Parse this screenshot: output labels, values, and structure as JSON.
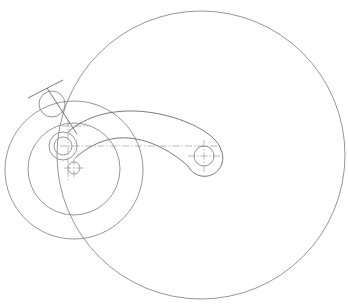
{
  "drawing": {
    "type": "mechanism-linkage-sketch",
    "line_color": "#8a8a8a",
    "background": "#ffffff",
    "circles": [
      {
        "name": "large-circle",
        "cx": 201,
        "cy": 155,
        "r": 144
      },
      {
        "name": "outer-concentric-circle",
        "cx": 74,
        "cy": 170,
        "r": 69
      },
      {
        "name": "inner-concentric-circle",
        "cx": 74,
        "cy": 169,
        "r": 46
      },
      {
        "name": "top-small-circle",
        "cx": 52,
        "cy": 104,
        "r": 13
      },
      {
        "name": "hub-outer-circle",
        "cx": 63,
        "cy": 146,
        "r": 14
      },
      {
        "name": "hub-inner-circle",
        "cx": 63,
        "cy": 146,
        "r": 9
      },
      {
        "name": "lower-small-circle",
        "cx": 74,
        "cy": 168,
        "r": 6
      },
      {
        "name": "pivot-circle",
        "cx": 204,
        "cy": 156,
        "r": 10
      }
    ],
    "lines": [
      {
        "name": "tangent-line",
        "x1": 28,
        "y1": 98,
        "x2": 63,
        "y2": 80
      },
      {
        "name": "link-line",
        "x1": 47,
        "y1": 88,
        "x2": 77,
        "y2": 134
      }
    ],
    "centerlines": [
      {
        "name": "arm-axis",
        "x1": 60,
        "y1": 146,
        "x2": 222,
        "y2": 146
      },
      {
        "name": "hub-vertical-axis",
        "x1": 68,
        "y1": 120,
        "x2": 68,
        "y2": 182
      },
      {
        "name": "hub-upper-horizontal",
        "x1": 62,
        "y1": 126,
        "x2": 88,
        "y2": 126
      },
      {
        "name": "lower-circle-horizontal",
        "x1": 64,
        "y1": 168,
        "x2": 86,
        "y2": 168
      },
      {
        "name": "lower-circle-vertical",
        "x1": 74,
        "y1": 158,
        "x2": 74,
        "y2": 178
      },
      {
        "name": "pivot-horizontal",
        "x1": 188,
        "y1": 156,
        "x2": 220,
        "y2": 156
      },
      {
        "name": "pivot-vertical",
        "x1": 204,
        "y1": 140,
        "x2": 204,
        "y2": 172
      }
    ],
    "arm_profile_path": "M 68 132 C 90 112, 130 104, 175 118 C 200 126, 218 138, 221 150 A 17 17 0 0 1 188 166 C 170 150, 145 136, 118 138 C 98 140, 84 150, 75 158"
  }
}
